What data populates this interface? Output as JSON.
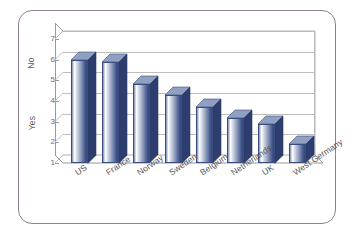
{
  "chart_data": {
    "type": "bar",
    "title": "",
    "subtitle": "",
    "xlabel": "",
    "ylabel": "",
    "categories": [
      "US",
      "France",
      "Norway",
      "Sweden",
      "Belgium",
      "Netherlands",
      "UK",
      "West Germany"
    ],
    "values": [
      6.0,
      5.9,
      4.8,
      4.3,
      3.7,
      3.2,
      2.9,
      1.9
    ],
    "ylim": [
      1,
      7
    ],
    "y_ticks": [
      "1",
      "2",
      "3",
      "4",
      "5",
      "6",
      "7"
    ],
    "y_axis_categories": [
      "Yes",
      "No"
    ],
    "grid": true,
    "legend": "none",
    "style": "3d-column",
    "series": [
      {
        "name": "Response",
        "values": [
          6.0,
          5.9,
          4.8,
          4.3,
          3.7,
          3.2,
          2.9,
          1.9
        ]
      }
    ]
  },
  "axes": {
    "y": {
      "ticks": [
        {
          "label": "7",
          "value": 7
        },
        {
          "label": "6",
          "value": 6
        },
        {
          "label": "5",
          "value": 5
        },
        {
          "label": "4",
          "value": 4
        },
        {
          "label": "3",
          "value": 3
        },
        {
          "label": "2",
          "value": 2
        },
        {
          "label": "1",
          "value": 1
        }
      ],
      "category_labels": [
        {
          "label": "No",
          "at_value": 5.8
        },
        {
          "label": "Yes",
          "at_value": 2.9
        }
      ]
    },
    "x": {
      "labels": [
        "US",
        "France",
        "Norway",
        "Sweden",
        "Belgium",
        "Netherlands",
        "UK",
        "West Germany"
      ]
    }
  },
  "colors": {
    "frame_border": "#8e7f93",
    "bar_dark": "#35477a",
    "bar_mid": "#41568c",
    "bar_light": "#ffffff",
    "bar_outline": "#3b4d80",
    "gridline": "#bdbdbd",
    "axis": "#9a9a9a",
    "tick_text": "#6b6b6b",
    "label_text": "#555555",
    "background": "#ffffff"
  }
}
